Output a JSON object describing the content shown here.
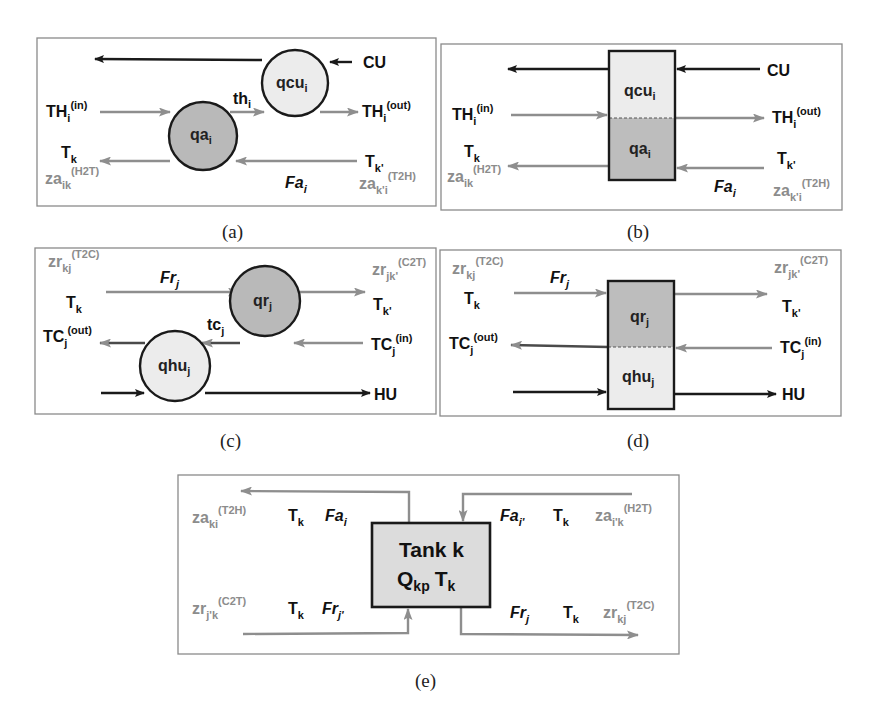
{
  "figure": {
    "colors": {
      "dark_stream": "#1a1a1a",
      "grey_stream": "#8e8e8e",
      "dark_node_fill": "#b9b9b9",
      "light_node_fill": "#ececec",
      "tank_fill": "#dcdcdc",
      "grey_label": "#8c8c8c"
    },
    "panels": {
      "a": {
        "caption": "(a)",
        "nodes": [
          {
            "id": "qcu",
            "base": "qcu",
            "sub": "i",
            "shape": "circle",
            "fill": "light"
          },
          {
            "id": "qa",
            "base": "qa",
            "sub": "i",
            "shape": "circle",
            "fill": "dark"
          }
        ],
        "labels": {
          "cu": "CU",
          "th_base": "th",
          "th_sub": "i",
          "thin_base": "TH",
          "thin_sub": "i",
          "thin_sup": "(in)",
          "thout_base": "TH",
          "thout_sub": "i",
          "thout_sup": "(out)",
          "tk_base": "T",
          "tk_sub": "k",
          "tkp_base": "T",
          "tkp_sub": "k'",
          "za_left_base": "za",
          "za_left_sub": "ik",
          "za_left_sup": "(H2T)",
          "za_right_base": "za",
          "za_right_sub": "k'i",
          "za_right_sup": "(T2H)",
          "fa_base": "Fa",
          "fa_sub": "i"
        }
      },
      "b": {
        "caption": "(b)",
        "nodes": [
          {
            "id": "qcu",
            "base": "qcu",
            "sub": "i",
            "shape": "box-top",
            "fill": "light"
          },
          {
            "id": "qa",
            "base": "qa",
            "sub": "i",
            "shape": "box-bottom",
            "fill": "dark"
          }
        ],
        "labels": {
          "cu": "CU",
          "thin_base": "TH",
          "thin_sub": "i",
          "thin_sup": "(in)",
          "thout_base": "TH",
          "thout_sub": "i",
          "thout_sup": "(out)",
          "tk_base": "T",
          "tk_sub": "k",
          "tkp_base": "T",
          "tkp_sub": "k'",
          "za_left_base": "za",
          "za_left_sub": "ik",
          "za_left_sup": "(H2T)",
          "za_right_base": "za",
          "za_right_sub": "k'i",
          "za_right_sup": "(T2H)",
          "fa_base": "Fa",
          "fa_sub": "i"
        }
      },
      "c": {
        "caption": "(c)",
        "nodes": [
          {
            "id": "qr",
            "base": "qr",
            "sub": "j",
            "shape": "circle",
            "fill": "dark"
          },
          {
            "id": "qhu",
            "base": "qhu",
            "sub": "j",
            "shape": "circle",
            "fill": "light"
          }
        ],
        "labels": {
          "hu": "HU",
          "tc_base": "tc",
          "tc_sub": "j",
          "zr_left_base": "zr",
          "zr_left_sub": "kj",
          "zr_left_sup": "(T2C)",
          "zr_right_base": "zr",
          "zr_right_sub": "jk'",
          "zr_right_sup": "(C2T)",
          "fr_base": "Fr",
          "fr_sub": "j",
          "tk_base": "T",
          "tk_sub": "k",
          "tkp_base": "T",
          "tkp_sub": "k'",
          "tcout_base": "TC",
          "tcout_sub": "j",
          "tcout_sup": "(out)",
          "tcin_base": "TC",
          "tcin_sub": "j",
          "tcin_sup": "(in)"
        }
      },
      "d": {
        "caption": "(d)",
        "nodes": [
          {
            "id": "qr",
            "base": "qr",
            "sub": "j",
            "shape": "box-top",
            "fill": "dark"
          },
          {
            "id": "qhu",
            "base": "qhu",
            "sub": "j",
            "shape": "box-bottom",
            "fill": "light"
          }
        ],
        "labels": {
          "hu": "HU",
          "zr_left_base": "zr",
          "zr_left_sub": "kj",
          "zr_left_sup": "(T2C)",
          "zr_right_base": "zr",
          "zr_right_sub": "jk'",
          "zr_right_sup": "(C2T)",
          "fr_base": "Fr",
          "fr_sub": "j",
          "tk_base": "T",
          "tk_sub": "k",
          "tkp_base": "T",
          "tkp_sub": "k'",
          "tcout_base": "TC",
          "tcout_sub": "j",
          "tcout_sup": "(out)",
          "tcin_base": "TC",
          "tcin_sub": "j",
          "tcin_sup": "(in)"
        }
      },
      "e": {
        "caption": "(e)",
        "tank": {
          "line1": "Tank k",
          "q_base": "Q",
          "q_sub": "kp",
          "t_base": "T",
          "t_sub": "k"
        },
        "labels": {
          "tl_za_base": "za",
          "tl_za_sub": "ki",
          "tl_za_sup": "(T2H)",
          "tl_t_base": "T",
          "tl_t_sub": "k",
          "tl_fa_base": "Fa",
          "tl_fa_sub": "i",
          "tr_fa_base": "Fa",
          "tr_fa_sub": "i'",
          "tr_t_base": "T",
          "tr_t_sub": "k",
          "tr_za_base": "za",
          "tr_za_sub": "i'k",
          "tr_za_sup": "(H2T)",
          "bl_zr_base": "zr",
          "bl_zr_sub": "j'k",
          "bl_zr_sup": "(C2T)",
          "bl_t_base": "T",
          "bl_t_sub": "k",
          "bl_fr_base": "Fr",
          "bl_fr_sub": "j'",
          "br_fr_base": "Fr",
          "br_fr_sub": "j",
          "br_t_base": "T",
          "br_t_sub": "k",
          "br_zr_base": "zr",
          "br_zr_sub": "kj",
          "br_zr_sup": "(T2C)"
        }
      }
    }
  }
}
